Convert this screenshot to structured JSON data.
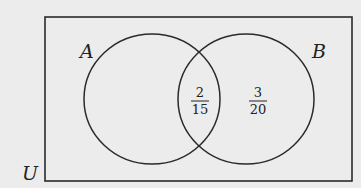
{
  "diagram": {
    "type": "venn",
    "universe": {
      "label": "U",
      "rect": {
        "x": 45,
        "y": 17,
        "width": 307,
        "height": 164
      }
    },
    "sets": [
      {
        "label": "A",
        "cx": 152,
        "cy": 99,
        "rx": 68,
        "ry": 65,
        "label_pos": {
          "x": 88,
          "y": 58
        }
      },
      {
        "label": "B",
        "cx": 246,
        "cy": 99,
        "rx": 68,
        "ry": 65,
        "label_pos": {
          "x": 320,
          "y": 58
        }
      }
    ],
    "regions": {
      "A_and_B": {
        "numerator": "2",
        "denominator": "15",
        "x": 200,
        "y": 100
      },
      "B_only": {
        "numerator": "3",
        "denominator": "20",
        "x": 258,
        "y": 100
      }
    },
    "colors": {
      "stroke": "#2a2a2a",
      "background": "#ececec",
      "text": "#222222"
    }
  }
}
